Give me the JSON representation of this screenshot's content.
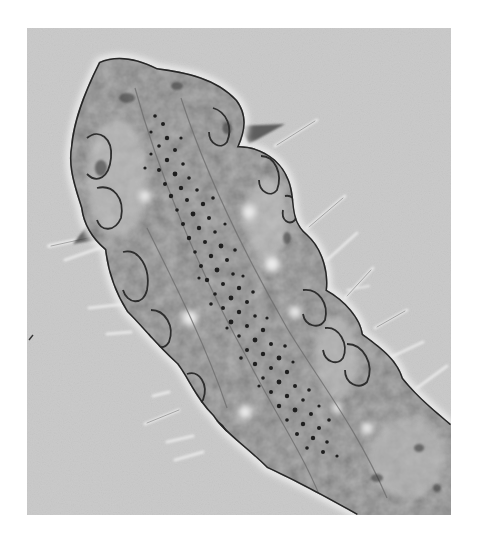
{
  "image": {
    "subject": "micrograph of segmented worm anterior body with setae",
    "style": "grayscale phase-contrast light microscopy",
    "frame": {
      "x": 27,
      "y": 28,
      "width": 424,
      "height": 487
    },
    "colors": {
      "page_background": "#ffffff",
      "field_background": "#c9c9c9",
      "body_fill": "#a8a8a8",
      "body_light": "#d6d6d6",
      "outline": "#2a2a2a",
      "granules": "#1c1c1c",
      "setae": "#e4e4e4",
      "halo": "#efefef"
    },
    "features": [
      "head lobe at upper left",
      "central gut with dense dark granules",
      "lateral segments with cell outlines",
      "fine setae radiating from both sides",
      "body continuing off bottom-right edge"
    ]
  }
}
